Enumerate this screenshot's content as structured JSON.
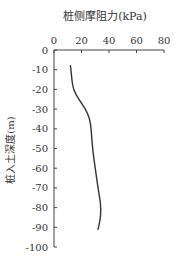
{
  "chart_data": {
    "type": "line",
    "title": "桩侧摩阻力(kPa)",
    "xlabel": "桩侧摩阻力(kPa)",
    "ylabel": "桩入土深度(m)",
    "xlim": [
      0,
      80
    ],
    "ylim": [
      -100,
      0
    ],
    "x_ticks": [
      "0",
      "20",
      "40",
      "60",
      "80"
    ],
    "y_ticks": [
      "0",
      "-10",
      "-20",
      "-30",
      "-40",
      "-50",
      "-60",
      "-70",
      "-80",
      "-90",
      "-100"
    ],
    "x_axis_position": "top",
    "grid": false,
    "legend": null,
    "series": [
      {
        "name": "桩侧摩阻力",
        "color": "#333333",
        "points": [
          {
            "x": 12,
            "y": -8
          },
          {
            "x": 13,
            "y": -15
          },
          {
            "x": 14,
            "y": -20
          },
          {
            "x": 18,
            "y": -25
          },
          {
            "x": 23,
            "y": -30
          },
          {
            "x": 26,
            "y": -35
          },
          {
            "x": 27,
            "y": -40
          },
          {
            "x": 28,
            "y": -50
          },
          {
            "x": 30,
            "y": -60
          },
          {
            "x": 32,
            "y": -70
          },
          {
            "x": 34,
            "y": -78
          },
          {
            "x": 34,
            "y": -84
          },
          {
            "x": 33,
            "y": -88
          },
          {
            "x": 32,
            "y": -91
          }
        ]
      }
    ]
  }
}
